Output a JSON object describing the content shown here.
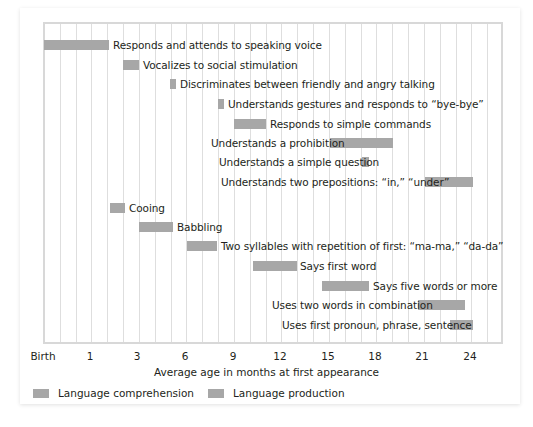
{
  "chart_data": {
    "type": "bar",
    "subtype": "timeline-gantt",
    "title": "",
    "xlabel": "Average age in months at first appearance",
    "ylabel": "",
    "x_ticks": [
      "Birth",
      "1",
      "3",
      "6",
      "9",
      "12",
      "15",
      "18",
      "21",
      "24"
    ],
    "grid": true,
    "legend_position": "bottom-left",
    "legend": [
      "Language comprehension",
      "Language production"
    ],
    "series": [
      {
        "name": "Language comprehension",
        "color": "#a7a7a7",
        "items": [
          {
            "label": "Responds and attends to speaking voice",
            "start": 0,
            "end": 1.5
          },
          {
            "label": "Vocalizes to social stimulation",
            "start": 1.8,
            "end": 2.3
          },
          {
            "label": "Discriminates between friendly and angry talking",
            "start": 5.0,
            "end": 5.2
          },
          {
            "label": "Understands gestures and responds to “bye-bye”",
            "start": 8.0,
            "end": 8.3
          },
          {
            "label": "Responds to simple commands",
            "start": 9.0,
            "end": 11.0
          },
          {
            "label": "Understands a prohibition",
            "start": 15.0,
            "end": 19.0
          },
          {
            "label": "Understands a simple question",
            "start": 17.0,
            "end": 17.5
          },
          {
            "label": "Understands two prepositions: “in,” “under”",
            "start": 21.0,
            "end": 24.0
          }
        ]
      },
      {
        "name": "Language production",
        "color": "#a7a7a7",
        "items": [
          {
            "label": "Cooing",
            "start": 1.5,
            "end": 2.0
          },
          {
            "label": "Babbling",
            "start": 3.0,
            "end": 5.0
          },
          {
            "label": "Two syllables with repetition of first: “ma-ma,” “da-da”",
            "start": 6.0,
            "end": 8.0
          },
          {
            "label": "Says first word",
            "start": 10.5,
            "end": 13.0
          },
          {
            "label": "Says five words or more",
            "start": 14.5,
            "end": 17.5
          },
          {
            "label": "Uses two words in combination",
            "start": 20.8,
            "end": 23.5
          },
          {
            "label": "Uses first pronoun, phrase, sentence",
            "start": 22.8,
            "end": 24.0
          }
        ]
      }
    ]
  },
  "rows": [
    {
      "label": "Responds and attends to speaking voice",
      "x": 44,
      "w": 65,
      "y": 40,
      "lx": 113
    },
    {
      "label": "Vocalizes to social stimulation",
      "x": 123,
      "w": 16,
      "y": 60,
      "lx": 143
    },
    {
      "label": "Discriminates between friendly and angry talking",
      "x": 170,
      "w": 6,
      "y": 79,
      "lx": 180
    },
    {
      "label": "Understands gestures and responds to “bye-bye”",
      "x": 218,
      "w": 6,
      "y": 99,
      "lx": 228
    },
    {
      "label": "Responds to simple commands",
      "x": 234,
      "w": 32,
      "y": 119,
      "lx": 270
    },
    {
      "label": "Understands a prohibition",
      "x": 330,
      "w": 63,
      "y": 138,
      "lx": 211
    },
    {
      "label": "Understands a simple question",
      "x": 362,
      "w": 7,
      "y": 157,
      "lx": 219
    },
    {
      "label": "Understands two prepositions: “in,” “under”",
      "x": 425,
      "w": 48,
      "y": 177,
      "lx": 221
    },
    {
      "label": "Cooing",
      "x": 110,
      "w": 15,
      "y": 203,
      "lx": 129
    },
    {
      "label": "Babbling",
      "x": 139,
      "w": 34,
      "y": 222,
      "lx": 177
    },
    {
      "label": "Two syllables with repetition of first: “ma-ma,” “da-da”",
      "x": 187,
      "w": 30,
      "y": 241,
      "lx": 221
    },
    {
      "label": "Says first word",
      "x": 253,
      "w": 44,
      "y": 261,
      "lx": 300
    },
    {
      "label": "Says five words or more",
      "x": 322,
      "w": 47,
      "y": 281,
      "lx": 373
    },
    {
      "label": "Uses two words in combination",
      "x": 418,
      "w": 47,
      "y": 300,
      "lx": 272
    },
    {
      "label": "Uses first pronoun, phrase, sentence",
      "x": 450,
      "w": 23,
      "y": 320,
      "lx": 282
    }
  ],
  "ticks": [
    {
      "label": "Birth",
      "x": 43
    },
    {
      "label": "1",
      "x": 90
    },
    {
      "label": "3",
      "x": 137
    },
    {
      "label": "6",
      "x": 185
    },
    {
      "label": "9",
      "x": 233
    },
    {
      "label": "12",
      "x": 280
    },
    {
      "label": "15",
      "x": 328
    },
    {
      "label": "18",
      "x": 375
    },
    {
      "label": "21",
      "x": 422
    },
    {
      "label": "24",
      "x": 470
    }
  ],
  "axis": {
    "xlabel": "Average age in months at first appearance"
  },
  "legend": {
    "comprehension": "Language comprehension",
    "production": "Language production"
  }
}
